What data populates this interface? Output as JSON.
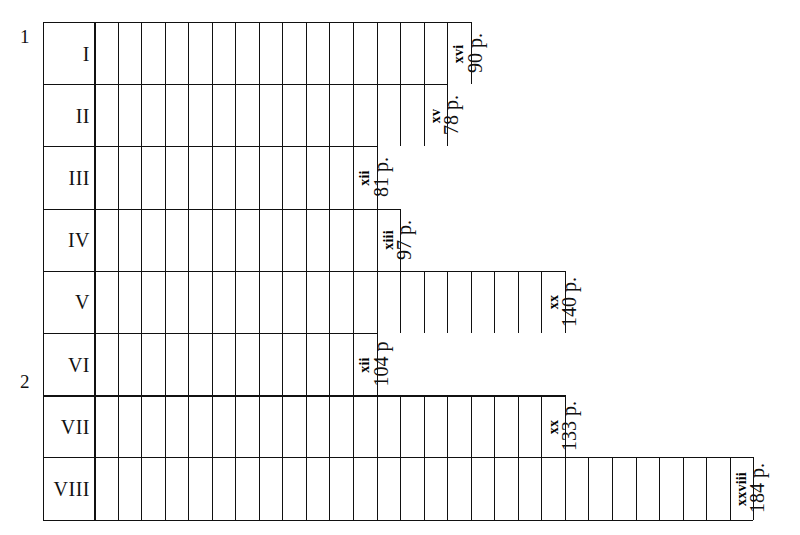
{
  "figure": {
    "axis_markers": [
      {
        "name": "marker-1",
        "label": "1"
      },
      {
        "name": "marker-2",
        "label": "2"
      }
    ],
    "unit_suffix": "p."
  },
  "chart_data": {
    "type": "bar",
    "orientation": "horizontal",
    "title": "",
    "xlabel": "",
    "ylabel": "",
    "grid": true,
    "legend": false,
    "note": "Each bar is divided into unit cells; the final cell of each bar carries a roman-numeral count, and a rotated caption at the bar end gives the page total.",
    "categories": [
      "I",
      "II",
      "III",
      "IV",
      "V",
      "VI",
      "VII",
      "VIII"
    ],
    "values": [
      90,
      78,
      81,
      97,
      140,
      104,
      133,
      184
    ],
    "cell_counts": [
      16,
      15,
      12,
      13,
      20,
      12,
      20,
      28
    ],
    "cell_count_roman": [
      "xvi",
      "xv",
      "xii",
      "xiii",
      "xx",
      "xii",
      "xx",
      "xxviii"
    ],
    "rows": [
      {
        "label": "I",
        "cells": 16,
        "count_roman": "xvi",
        "pages_label": "90 p.",
        "pages": 90,
        "thick_top": false
      },
      {
        "label": "II",
        "cells": 15,
        "count_roman": "xv",
        "pages_label": "78 p.",
        "pages": 78,
        "thick_top": false
      },
      {
        "label": "III",
        "cells": 12,
        "count_roman": "xii",
        "pages_label": "81 p.",
        "pages": 81,
        "thick_top": false
      },
      {
        "label": "IV",
        "cells": 13,
        "count_roman": "xiii",
        "pages_label": "97 p.",
        "pages": 97,
        "thick_top": false
      },
      {
        "label": "V",
        "cells": 20,
        "count_roman": "xx",
        "pages_label": "140 p.",
        "pages": 140,
        "thick_top": false
      },
      {
        "label": "VI",
        "cells": 12,
        "count_roman": "xii",
        "pages_label": "104 p",
        "pages": 104,
        "thick_top": false
      },
      {
        "label": "VII",
        "cells": 20,
        "count_roman": "xx",
        "pages_label": "133 p.",
        "pages": 133,
        "thick_top": true
      },
      {
        "label": "VIII",
        "cells": 28,
        "count_roman": "xxviii",
        "pages_label": "184 p.",
        "pages": 184,
        "thick_top": false
      }
    ]
  }
}
